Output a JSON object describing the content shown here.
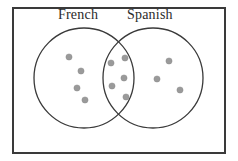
{
  "figure": {
    "type": "venn-diagram",
    "width": 238,
    "height": 161,
    "background_color": "#ffffff"
  },
  "frame": {
    "name": "universal-set-rectangle",
    "x": 13,
    "y": 8,
    "width": 212,
    "height": 145,
    "stroke_color": "#3a3a3a",
    "stroke_width": 2,
    "fill": "none"
  },
  "labels": {
    "left_set": "French",
    "right_set": "Spanish",
    "text_color": "#2b2b2b",
    "font_size_px": 14
  },
  "circles": [
    {
      "name": "french-circle",
      "label": "French",
      "cx": 84,
      "cy": 78,
      "r": 50,
      "stroke_color": "#3a3a3a",
      "stroke_width": 1.3,
      "fill": "none"
    },
    {
      "name": "spanish-circle",
      "label": "Spanish",
      "cx": 153,
      "cy": 78,
      "r": 50,
      "stroke_color": "#3a3a3a",
      "stroke_width": 1.3,
      "fill": "none"
    }
  ],
  "dot_style": {
    "radius": 3.1,
    "fill_color": "#9a9a9a",
    "stroke_color": "#8c8c8c",
    "stroke_width": 0.5
  },
  "regions": [
    {
      "name": "french-only",
      "label": "French only",
      "count": 4,
      "dots": [
        {
          "cx": 69,
          "cy": 57
        },
        {
          "cx": 81,
          "cy": 71
        },
        {
          "cx": 77,
          "cy": 88
        },
        {
          "cx": 85,
          "cy": 100
        }
      ]
    },
    {
      "name": "french-and-spanish",
      "label": "Both French and Spanish",
      "count": 5,
      "dots": [
        {
          "cx": 125,
          "cy": 58
        },
        {
          "cx": 111,
          "cy": 63
        },
        {
          "cx": 124,
          "cy": 78
        },
        {
          "cx": 112,
          "cy": 86
        },
        {
          "cx": 126,
          "cy": 97
        }
      ]
    },
    {
      "name": "spanish-only",
      "label": "Spanish only",
      "count": 3,
      "dots": [
        {
          "cx": 169,
          "cy": 61
        },
        {
          "cx": 157,
          "cy": 79
        },
        {
          "cx": 180,
          "cy": 90
        }
      ]
    }
  ],
  "chart_data": {
    "type": "venn",
    "title": "",
    "sets": [
      "French",
      "Spanish"
    ],
    "categories": [
      "French only",
      "Both French and Spanish",
      "Spanish only"
    ],
    "values": [
      4,
      5,
      3
    ],
    "totals": {
      "French": 9,
      "Spanish": 8,
      "all_points": 12
    },
    "outside_sets": 0,
    "legend": "none",
    "grid": false
  }
}
